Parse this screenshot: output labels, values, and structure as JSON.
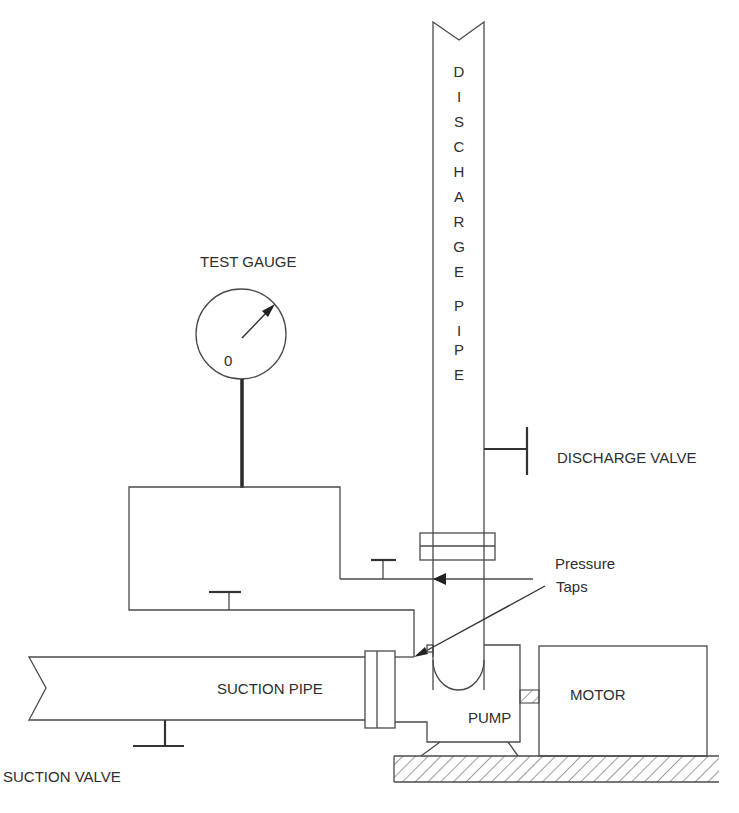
{
  "diagram": {
    "labels": {
      "discharge_pipe_letters": [
        "D",
        "I",
        "S",
        "C",
        "H",
        "A",
        "R",
        "G",
        "E",
        "",
        "P",
        "I",
        "P",
        "E"
      ],
      "test_gauge": "TEST GAUGE",
      "gauge_zero": "0",
      "discharge_valve": "DISCHARGE VALVE",
      "pressure_taps_line1": "Pressure",
      "pressure_taps_line2": "Taps",
      "suction_pipe": "SUCTION PIPE",
      "pump": "PUMP",
      "motor": "MOTOR",
      "suction_valve": "SUCTION VALVE"
    },
    "components": [
      "discharge-pipe",
      "test-gauge",
      "discharge-valve",
      "pressure-taps",
      "suction-pipe",
      "pump",
      "motor",
      "suction-valve",
      "base-foundation",
      "coupling"
    ],
    "colors": {
      "line": "#4a4a4a",
      "text": "#2e2e2e",
      "background": "#ffffff"
    }
  }
}
